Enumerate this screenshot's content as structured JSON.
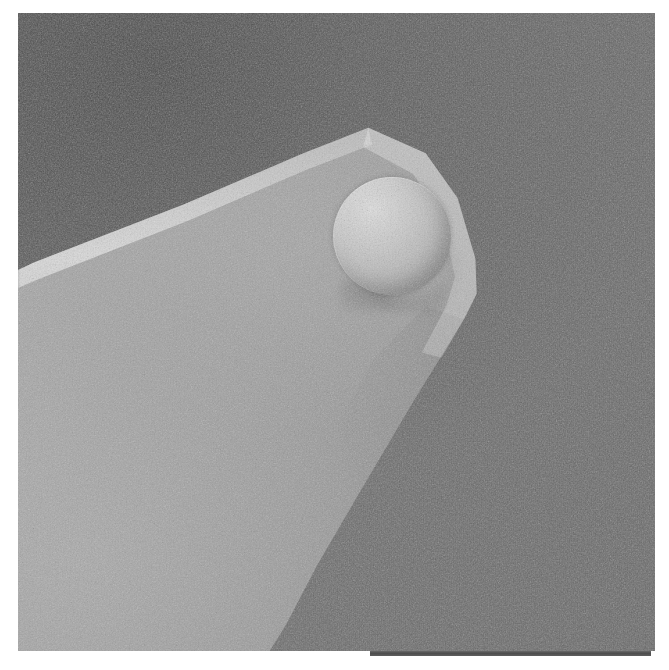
{
  "image": {
    "kind": "sem-micrograph",
    "caption": "",
    "subject": "colloidal-probe: microsphere attached to AFM cantilever tip",
    "canvas": {
      "left": 18,
      "top": 13,
      "width": 637,
      "height": 638
    }
  },
  "colors": {
    "page_background": "#ffffff",
    "background_dark": "#636363",
    "background_dark_upper_left": "#5d5d5d",
    "cantilever_light": "#9c9c9c",
    "cantilever_bright_edge": "#d2d2d2",
    "sphere_highlight": "#e2e2e2",
    "sphere_shadow": "#8b8b8b",
    "scale_bar": "#4c4c4c"
  },
  "features": {
    "sphere": {
      "name": "microsphere",
      "center_x": 392,
      "center_y": 236,
      "diameter": 118
    },
    "cantilever": {
      "name": "cantilever-wedge",
      "apex_x": 477,
      "apex_y": 280
    }
  },
  "scale_bar": {
    "present": true,
    "label": "",
    "left": 370,
    "top": 651,
    "width": 281,
    "height": 5
  }
}
